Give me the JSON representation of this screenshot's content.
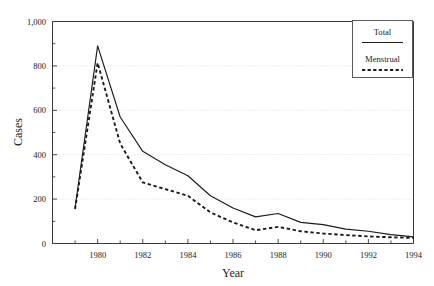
{
  "chart_data": {
    "type": "line",
    "title": "",
    "xlabel": "Year",
    "ylabel": "Cases",
    "xlim": [
      1978,
      1994
    ],
    "ylim": [
      0,
      1000
    ],
    "grid": true,
    "legend_position": "top-right",
    "x": [
      1979,
      1980,
      1981,
      1982,
      1983,
      1984,
      1985,
      1986,
      1987,
      1988,
      1989,
      1990,
      1991,
      1992,
      1993,
      1994
    ],
    "xtick_labels": [
      "1980",
      "1982",
      "1984",
      "1986",
      "1988",
      "1990",
      "1992",
      "1994"
    ],
    "xtick_values": [
      1980,
      1982,
      1984,
      1986,
      1988,
      1990,
      1992,
      1994
    ],
    "ytick_labels": [
      "0",
      "200",
      "400",
      "600",
      "800",
      "1,000"
    ],
    "ytick_values": [
      0,
      200,
      400,
      600,
      800,
      1000
    ],
    "series": [
      {
        "name": "Total",
        "style": "solid",
        "values": [
          160,
          890,
          570,
          415,
          355,
          305,
          215,
          160,
          120,
          135,
          95,
          85,
          65,
          55,
          40,
          30
        ]
      },
      {
        "name": "Menstrual",
        "style": "dashed",
        "values": [
          155,
          814,
          450,
          275,
          245,
          215,
          140,
          95,
          60,
          75,
          55,
          45,
          38,
          32,
          28,
          25
        ]
      }
    ]
  },
  "axis": {
    "y_title": "Cases",
    "x_title": "Year"
  },
  "legend": {
    "entries": [
      {
        "label": "Total",
        "style": "solid"
      },
      {
        "label": "Menstrual",
        "style": "dashed"
      }
    ]
  },
  "caption": {
    "text": ""
  }
}
